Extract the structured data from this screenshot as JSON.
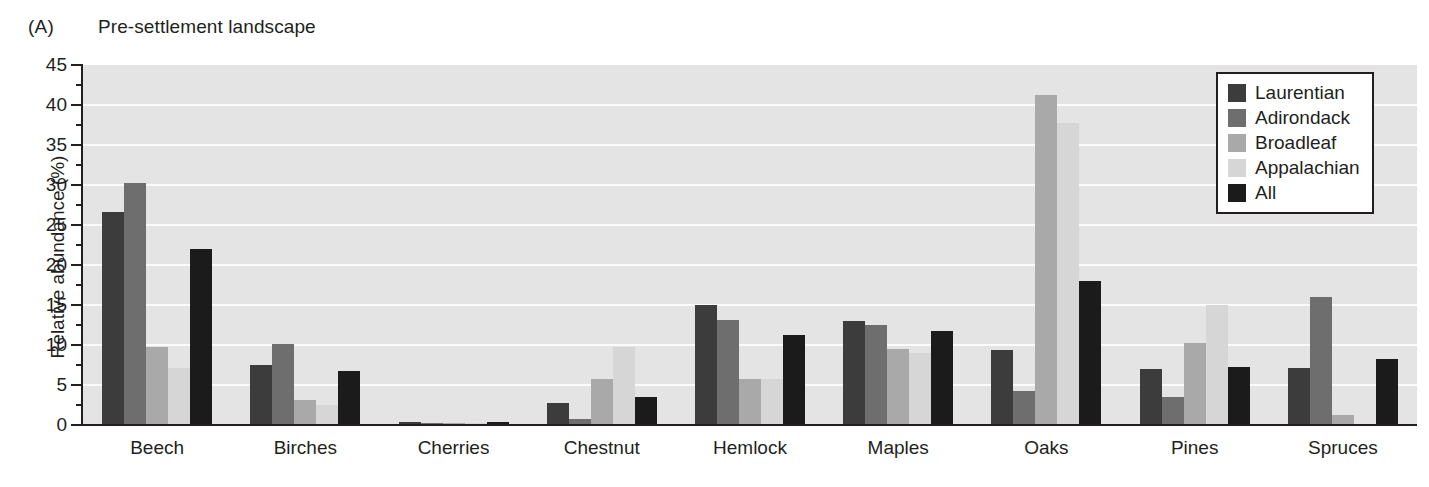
{
  "panel": {
    "letter": "(A)",
    "title": "Pre-settlement landscape"
  },
  "chart_data": {
    "type": "bar",
    "title": "Pre-settlement landscape",
    "xlabel": "",
    "ylabel": "Relative abundance (%)",
    "ylim": [
      0,
      45
    ],
    "ytick_step": 5,
    "ytick_labels": [
      "0",
      "5",
      "10",
      "15",
      "20",
      "25",
      "30",
      "35",
      "40",
      "45"
    ],
    "grid": true,
    "legend_position": "top-right",
    "categories": [
      "Beech",
      "Birches",
      "Cherries",
      "Chestnut",
      "Hemlock",
      "Maples",
      "Oaks",
      "Pines",
      "Spruces"
    ],
    "series": [
      {
        "name": "Laurentian",
        "color": "#3c3c3c",
        "values": [
          26.6,
          7.5,
          0.4,
          2.7,
          15.0,
          13.0,
          9.4,
          7.0,
          7.1
        ]
      },
      {
        "name": "Adirondack",
        "color": "#6e6e6e",
        "values": [
          30.3,
          10.1,
          0.3,
          0.8,
          13.1,
          12.5,
          4.3,
          3.5,
          16.0
        ]
      },
      {
        "name": "Broadleaf",
        "color": "#a9a9a9",
        "values": [
          9.7,
          3.1,
          0.3,
          5.7,
          5.8,
          9.5,
          41.2,
          10.3,
          1.3
        ]
      },
      {
        "name": "Appalachian",
        "color": "#d6d6d6",
        "values": [
          7.1,
          2.5,
          0.2,
          9.7,
          5.8,
          9.0,
          37.8,
          15.0,
          0.1
        ]
      },
      {
        "name": "All",
        "color": "#1b1b1b",
        "values": [
          22.0,
          6.8,
          0.4,
          3.5,
          11.2,
          11.7,
          18.0,
          7.3,
          8.2
        ]
      }
    ]
  },
  "style": {
    "plot_background": "#e4e4e4",
    "gridline_color": "#fbfbfb",
    "axis_color": "#231f20",
    "page_background": "#ffffff"
  }
}
